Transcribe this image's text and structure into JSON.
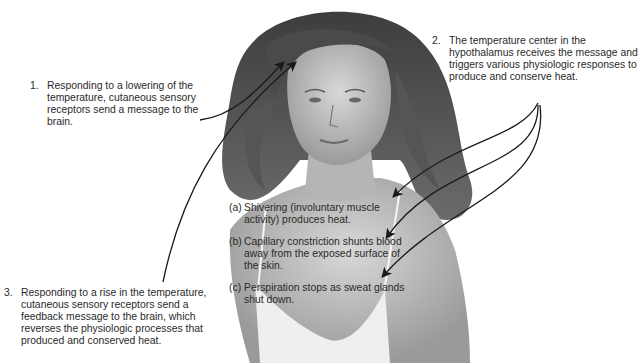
{
  "figure": {
    "steps": [
      {
        "number": "1.",
        "text": "Responding to a lowering of the temperature, cutaneous sensory receptors send a message to the brain."
      },
      {
        "number": "2.",
        "text": "The temperature center in the hypothalamus receives the message and triggers various physiologic responses to produce and conserve heat."
      },
      {
        "number": "3.",
        "text": "Responding to a rise in the temperature, cutaneous sensory receptors send a feedback message to the brain, which reverses the physiologic processes that produced and conserved heat."
      }
    ],
    "responses": [
      {
        "letter": "(a)",
        "text": "Shivering (involuntary muscle activity) produces heat."
      },
      {
        "letter": "(b)",
        "text": "Capillary constriction shunts blood away from the exposed surface of the skin."
      },
      {
        "letter": "(c)",
        "text": "Perspiration stops as sweat glands shut down."
      }
    ],
    "colors": {
      "text": "#2a2a2a",
      "arrow": "#1a1a1a",
      "background": "#ffffff",
      "skin": "#bdbdbd",
      "hair": "#5a5a5a"
    }
  }
}
